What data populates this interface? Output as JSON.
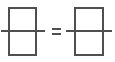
{
  "figure": {
    "canvas": {
      "width": 115,
      "height": 62,
      "background": "#ffffff"
    },
    "stroke": {
      "color": "#4f4f4f",
      "rect_width": 2,
      "line_width": 2
    },
    "equals_sign": {
      "label": "=",
      "bars": [
        {
          "x": 52,
          "y": 28,
          "width": 9,
          "height": 2
        },
        {
          "x": 52,
          "y": 33,
          "width": 9,
          "height": 2
        }
      ]
    },
    "shapes": [
      {
        "name": "left-rectangle",
        "type": "rect",
        "x": 8,
        "y": 7,
        "width": 29,
        "height": 49
      },
      {
        "name": "left-horizontal-line",
        "type": "line",
        "x1": 1,
        "y1": 31,
        "x2": 45,
        "y2": 31
      },
      {
        "name": "right-rectangle",
        "type": "rect",
        "x": 74,
        "y": 7,
        "width": 30,
        "height": 49
      },
      {
        "name": "right-horizontal-line",
        "type": "line",
        "x1": 66,
        "y1": 31,
        "x2": 112,
        "y2": 31
      }
    ]
  }
}
